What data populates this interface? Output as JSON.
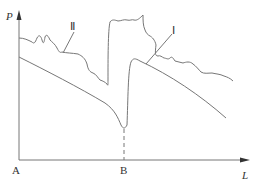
{
  "diagram": {
    "axes": {
      "y_label": "P",
      "x_label": "L",
      "origin_label": "A",
      "mark_label": "B"
    },
    "curves": [
      {
        "id": "I",
        "label": "Ⅰ",
        "description": "lower smooth curve with sharp dip at B"
      },
      {
        "id": "II",
        "label": "Ⅱ",
        "description": "upper wavy curve with sharp dip before B"
      }
    ],
    "colors": {
      "line": "#777777",
      "text": "#333333"
    }
  }
}
